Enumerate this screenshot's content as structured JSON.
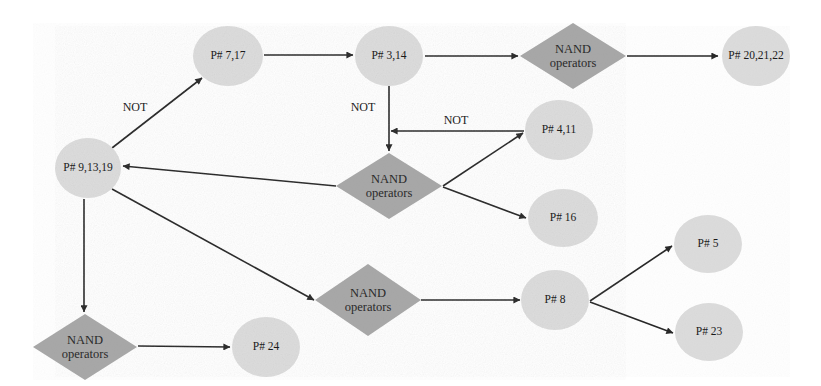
{
  "diagram": {
    "colors": {
      "state_fill": "#dcdcdc",
      "operator_fill": "#a8a8a8",
      "edge": "#222222",
      "background": "#ffffff"
    },
    "nodes": [
      {
        "id": "p7_17",
        "type": "state",
        "label": "P# 7,17",
        "cx": 228,
        "cy": 56,
        "rx": 35,
        "ry": 30
      },
      {
        "id": "p3_14",
        "type": "state",
        "label": "P# 3,14",
        "cx": 389,
        "cy": 56,
        "rx": 34,
        "ry": 30
      },
      {
        "id": "nand_top",
        "type": "operator",
        "label_line1": "NAND",
        "label_line2": "operators",
        "cx": 573,
        "cy": 56,
        "w": 106,
        "h": 64
      },
      {
        "id": "p20_21_22",
        "type": "state",
        "label": "P# 20,21,22",
        "cx": 752,
        "cy": 56,
        "rx": 34,
        "ry": 30
      },
      {
        "id": "p9_13_19",
        "type": "state",
        "label": "P# 9,13,19",
        "cx": 88,
        "cy": 168,
        "rx": 33,
        "ry": 30
      },
      {
        "id": "nand_mid",
        "type": "operator",
        "label_line1": "NAND",
        "label_line2": "operators",
        "cx": 389,
        "cy": 186,
        "w": 106,
        "h": 66
      },
      {
        "id": "p4_11",
        "type": "state",
        "label": "P# 4,11",
        "cx": 559,
        "cy": 130,
        "rx": 34,
        "ry": 30
      },
      {
        "id": "p16",
        "type": "state",
        "label": "P# 16",
        "cx": 563,
        "cy": 218,
        "rx": 35,
        "ry": 29
      },
      {
        "id": "nand_low",
        "type": "operator",
        "label_line1": "NAND",
        "label_line2": "operators",
        "cx": 368,
        "cy": 300,
        "w": 106,
        "h": 72
      },
      {
        "id": "p8",
        "type": "state",
        "label": "P# 8",
        "cx": 555,
        "cy": 300,
        "rx": 34,
        "ry": 30
      },
      {
        "id": "p5",
        "type": "state",
        "label": "P# 5",
        "cx": 708,
        "cy": 244,
        "rx": 34,
        "ry": 29
      },
      {
        "id": "p23",
        "type": "state",
        "label": "P# 23",
        "cx": 709,
        "cy": 332,
        "rx": 34,
        "ry": 29
      },
      {
        "id": "nand_left",
        "type": "operator",
        "label_line1": "NAND",
        "label_line2": "operators",
        "cx": 85,
        "cy": 347,
        "w": 104,
        "h": 66
      },
      {
        "id": "p24",
        "type": "state",
        "label": "P# 24",
        "cx": 266,
        "cy": 347,
        "rx": 34,
        "ry": 30
      }
    ],
    "edges": [
      {
        "from": "p9_13_19",
        "to": "p7_17",
        "label": "NOT",
        "label_x": 135,
        "label_y": 108
      },
      {
        "from": "p7_17",
        "to": "p3_14",
        "label": ""
      },
      {
        "from": "p3_14",
        "to": "nand_top",
        "label": ""
      },
      {
        "from": "nand_top",
        "to": "p20_21_22",
        "label": ""
      },
      {
        "from": "p3_14",
        "to": "nand_mid",
        "label": "NOT",
        "label_x": 363,
        "label_y": 108
      },
      {
        "from": "p4_11",
        "to": "nand_mid",
        "label": "NOT",
        "label_x": 456,
        "label_y": 121
      },
      {
        "from": "nand_mid",
        "to": "p9_13_19",
        "label": ""
      },
      {
        "from": "nand_mid",
        "to": "p4_11",
        "label": ""
      },
      {
        "from": "nand_mid",
        "to": "p16",
        "label": ""
      },
      {
        "from": "p9_13_19",
        "to": "nand_low",
        "label": ""
      },
      {
        "from": "nand_low",
        "to": "p8",
        "label": ""
      },
      {
        "from": "p8",
        "to": "p5",
        "label": ""
      },
      {
        "from": "p8",
        "to": "p23",
        "label": ""
      },
      {
        "from": "p9_13_19",
        "to": "nand_left",
        "label": ""
      },
      {
        "from": "nand_left",
        "to": "p24",
        "label": ""
      }
    ],
    "edge_labels": {
      "not_1": "NOT",
      "not_2": "NOT",
      "not_3": "NOT"
    }
  }
}
